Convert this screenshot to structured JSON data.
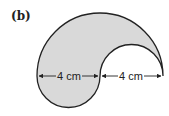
{
  "part_label": "(b)",
  "figure": {
    "shape": "composite semicircles (yin-yang like crescent)",
    "fill_color": "#d9d9d9",
    "stroke_color": "#222222",
    "outer_semicircle": {
      "diameter_cm": 8,
      "position": "top"
    },
    "lower_left_semicircle": {
      "diameter_cm": 4,
      "position": "bottom-left, bulging down"
    },
    "inner_right_semicircle": {
      "diameter_cm": 4,
      "position": "cut out from top-right"
    }
  },
  "dimensions": [
    {
      "label": "4 cm",
      "segment": "left"
    },
    {
      "label": "4 cm",
      "segment": "right"
    }
  ]
}
